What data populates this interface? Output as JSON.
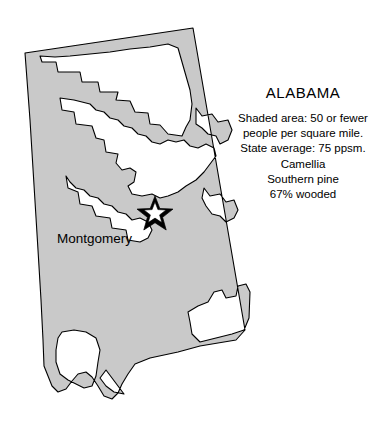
{
  "map": {
    "title": "ALABAMA",
    "shaded_color": "#c9c9c9",
    "unshaded_color": "#ffffff",
    "outline_color": "#000000",
    "background_color": "#ffffff",
    "city_marker": {
      "name": "capital-star",
      "label": "Montgomery",
      "x": 155,
      "y": 210
    },
    "info_lines": [
      "Shaded area: 50 or fewer",
      "people per square mile.",
      "State average: 75 ppsm.",
      "Camellia",
      "Southern pine",
      "67% wooded"
    ],
    "legend": {
      "shaded_meaning": "50 or fewer people per square mile",
      "state_average_ppsm": 75,
      "state_flower": "Camellia",
      "state_tree": "Southern pine",
      "percent_wooded": 67
    }
  }
}
